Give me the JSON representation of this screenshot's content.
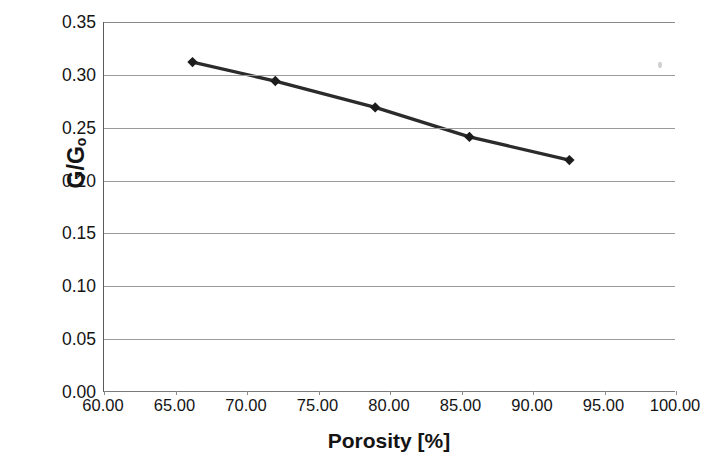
{
  "chart_data": {
    "type": "line",
    "title": "",
    "xlabel": "Porosity [%]",
    "ylabel": "G/Gₒ",
    "ylabel_main": "G/G",
    "ylabel_sub": "o",
    "xlim": [
      60,
      100
    ],
    "ylim": [
      0.0,
      0.35
    ],
    "grid": "horizontal",
    "legend": "none",
    "marker": "diamond",
    "line_color": "#2b2b2b",
    "marker_color": "#1c1c1c",
    "gridline_color": "#9a9a9a",
    "x_ticks": [
      60,
      65,
      70,
      75,
      80,
      85,
      90,
      95,
      100
    ],
    "x_tick_labels": [
      "60.00",
      "65.00",
      "70.00",
      "75.00",
      "80.00",
      "85.00",
      "90.00",
      "95.00",
      "100.00"
    ],
    "y_ticks": [
      0.0,
      0.05,
      0.1,
      0.15,
      0.2,
      0.25,
      0.3,
      0.35
    ],
    "y_tick_labels": [
      "0.00",
      "0.05",
      "0.10",
      "0.15",
      "0.20",
      "0.25",
      "0.30",
      "0.35"
    ],
    "series": [
      {
        "name": "G/Gₒ vs Porosity",
        "x": [
          66.2,
          72.0,
          79.0,
          85.6,
          92.6
        ],
        "values": [
          0.312,
          0.294,
          0.269,
          0.241,
          0.219
        ]
      }
    ],
    "points": [
      {
        "x": 66.2,
        "y": 0.312
      },
      {
        "x": 72.0,
        "y": 0.294
      },
      {
        "x": 79.0,
        "y": 0.269
      },
      {
        "x": 85.6,
        "y": 0.241
      },
      {
        "x": 92.6,
        "y": 0.219
      }
    ]
  }
}
